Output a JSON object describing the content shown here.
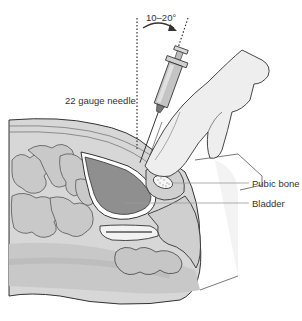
{
  "figure": {
    "annotations": {
      "angle": "10–20°",
      "needle": "22 gauge needle",
      "pubic_bone": "Pubic bone",
      "bladder": "Bladder"
    },
    "colors": {
      "background": "#ffffff",
      "outline": "#333333",
      "bladder_fill": "#8f8f8f",
      "bladder_wall": "#ffffff",
      "tissue_fill": "#d4d4d4",
      "tissue_dark": "#bdbdbd",
      "bowel_fill": "#c6c6c6",
      "skin_fill": "#e4e4e4",
      "hand_fill": "#eeeeee",
      "bone_fill": "#f4f4f4",
      "syringe_fill": "#c8c8c8",
      "leader_line": "#999999"
    }
  }
}
